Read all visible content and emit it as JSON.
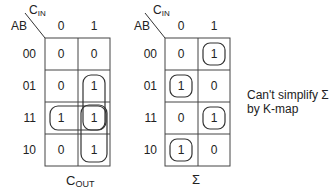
{
  "kmaps": [
    {
      "id": "cout",
      "title_main": "C",
      "title_sub": "OUT",
      "row_var": "AB",
      "col_var_main": "C",
      "col_var_sub": "IN",
      "col_labels": [
        "0",
        "1"
      ],
      "row_labels": [
        "00",
        "01",
        "11",
        "10"
      ],
      "cells": [
        [
          "0",
          "0"
        ],
        [
          "0",
          "1"
        ],
        [
          "1",
          "1"
        ],
        [
          "0",
          "1"
        ]
      ],
      "groups": [
        {
          "cells": "rows 01-11, col 1",
          "orientation": "vertical"
        },
        {
          "cells": "row 11, cols 0-1",
          "orientation": "horizontal"
        },
        {
          "cells": "rows 11-10, col 1",
          "orientation": "vertical"
        }
      ]
    },
    {
      "id": "sum",
      "title_main": "Σ",
      "row_var": "AB",
      "col_var_main": "C",
      "col_var_sub": "IN",
      "col_labels": [
        "0",
        "1"
      ],
      "row_labels": [
        "00",
        "01",
        "11",
        "10"
      ],
      "cells": [
        [
          "0",
          "1"
        ],
        [
          "1",
          "0"
        ],
        [
          "0",
          "1"
        ],
        [
          "1",
          "0"
        ]
      ],
      "groups": [
        {
          "cells": "row 00, col 1"
        },
        {
          "cells": "row 01, col 0"
        },
        {
          "cells": "row 11, col 1"
        },
        {
          "cells": "row 10, col 0"
        }
      ]
    }
  ],
  "note": {
    "line1": "Can't simplify Σ",
    "line2": "by K-map"
  }
}
